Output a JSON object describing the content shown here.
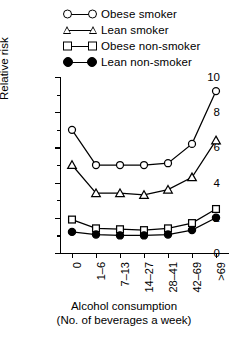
{
  "chart_data": {
    "type": "line",
    "title": "",
    "xlabel": "Alcohol consumption",
    "xlabel_line2": "(No. of beverages a week)",
    "ylabel": "Relative risk",
    "categories": [
      "0",
      "1–6",
      "7–13",
      "14–27",
      "28–41",
      "42–69",
      ">69"
    ],
    "ylim": [
      0,
      10
    ],
    "yticks": [
      0,
      2,
      4,
      6,
      8,
      10
    ],
    "ytick_labels": [
      "0",
      "2",
      "4",
      "6",
      "8",
      "10"
    ],
    "yminor": [
      1,
      3,
      5,
      7,
      9
    ],
    "grid": false,
    "legend_position": "top",
    "series": [
      {
        "name": "Obese smoker",
        "marker": "open-circle",
        "values": [
          7.0,
          5.0,
          5.0,
          5.0,
          5.1,
          6.2,
          9.2
        ]
      },
      {
        "name": "Lean smoker",
        "marker": "open-triangle",
        "values": [
          5.0,
          3.4,
          3.4,
          3.3,
          3.6,
          4.3,
          6.4
        ]
      },
      {
        "name": "Obese non-smoker",
        "marker": "open-square",
        "values": [
          1.9,
          1.4,
          1.35,
          1.3,
          1.4,
          1.7,
          2.5
        ]
      },
      {
        "name": "Lean non-smoker",
        "marker": "filled-circle",
        "values": [
          1.2,
          1.05,
          1.0,
          1.0,
          1.05,
          1.3,
          2.0
        ]
      }
    ]
  },
  "legend": {
    "items": [
      {
        "label": "Obese smoker",
        "marker": "open-circle"
      },
      {
        "label": "Lean smoker",
        "marker": "open-triangle"
      },
      {
        "label": "Obese non-smoker",
        "marker": "open-square"
      },
      {
        "label": "Lean non-smoker",
        "marker": "filled-circle"
      }
    ]
  }
}
